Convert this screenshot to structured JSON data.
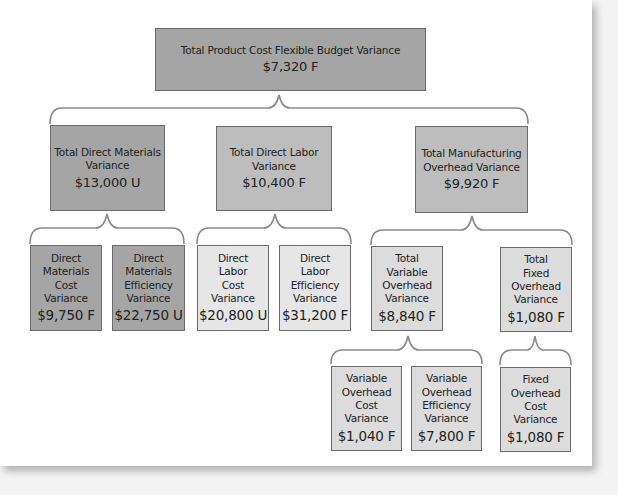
{
  "diagram": {
    "type": "variance-tree",
    "root": {
      "label": "Total Product Cost Flexible Budget Variance",
      "value": "$7,320 F"
    },
    "level1": [
      {
        "label": "Total Direct Materials Variance",
        "value": "$13,000 U"
      },
      {
        "label": "Total Direct Labor Variance",
        "value": "$10,400 F"
      },
      {
        "label": "Total Manufacturing Overhead Variance",
        "value": "$9,920 F"
      }
    ],
    "materials_children": [
      {
        "label": "Direct Materials Cost Variance",
        "value": "$9,750 F"
      },
      {
        "label": "Direct Materials Efficiency Variance",
        "value": "$22,750 U"
      }
    ],
    "labor_children": [
      {
        "label": "Direct Labor Cost Variance",
        "value": "$20,800 U"
      },
      {
        "label": "Direct Labor Efficiency Variance",
        "value": "$31,200 F"
      }
    ],
    "overhead_children": [
      {
        "label": "Total Variable Overhead Variance",
        "value": "$8,840 F"
      },
      {
        "label": "Total Fixed Overhead Variance",
        "value": "$1,080 F"
      }
    ],
    "variable_overhead_children": [
      {
        "label": "Variable Overhead Cost Variance",
        "value": "$1,040 F"
      },
      {
        "label": "Variable Overhead Efficiency Variance",
        "value": "$7,800 F"
      }
    ],
    "fixed_overhead_children": [
      {
        "label": "Fixed Overhead Cost Variance",
        "value": "$1,080 F"
      }
    ]
  }
}
